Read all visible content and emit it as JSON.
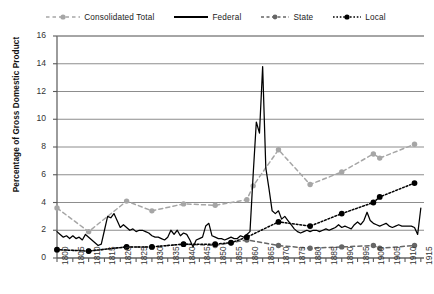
{
  "chart_data": {
    "type": "line",
    "title": "",
    "xlabel": "",
    "ylabel": "Percentage of Gross Domestic Product",
    "xlim": [
      1800,
      1916
    ],
    "ylim": [
      0,
      16
    ],
    "ytick_step": 2,
    "xtick_step": 5,
    "grid": "horizontal",
    "legend_position": "top",
    "yticks": [
      "0",
      "2",
      "4",
      "6",
      "8",
      "10",
      "12",
      "14",
      "16"
    ],
    "xticks": [
      "1800",
      "1805",
      "1810",
      "1815",
      "1820",
      "1825",
      "1830",
      "1835",
      "1840",
      "1845",
      "1850",
      "1855",
      "1860",
      "1865",
      "1870",
      "1875",
      "1880",
      "1885",
      "1890",
      "1895",
      "1900",
      "1905",
      "1910",
      "1915"
    ],
    "series": [
      {
        "name": "Consolidated Total",
        "color": "#a6a6a6",
        "style": "dashed-marker",
        "x": [
          1800,
          1810,
          1822,
          1830,
          1840,
          1850,
          1860,
          1862,
          1870,
          1880,
          1890,
          1900,
          1902,
          1913
        ],
        "values": [
          3.6,
          1.9,
          4.1,
          3.4,
          3.9,
          3.8,
          4.2,
          5.2,
          7.8,
          5.3,
          6.2,
          7.5,
          7.2,
          8.2
        ]
      },
      {
        "name": "Federal",
        "color": "#000000",
        "style": "solid",
        "x": [
          1800,
          1801,
          1802,
          1803,
          1804,
          1805,
          1806,
          1807,
          1808,
          1809,
          1810,
          1811,
          1812,
          1813,
          1814,
          1815,
          1816,
          1817,
          1818,
          1819,
          1820,
          1821,
          1822,
          1823,
          1824,
          1825,
          1826,
          1827,
          1828,
          1829,
          1830,
          1831,
          1832,
          1833,
          1834,
          1835,
          1836,
          1837,
          1838,
          1839,
          1840,
          1841,
          1842,
          1843,
          1844,
          1845,
          1846,
          1847,
          1848,
          1849,
          1850,
          1851,
          1852,
          1853,
          1854,
          1855,
          1856,
          1857,
          1858,
          1859,
          1860,
          1861,
          1862,
          1863,
          1864,
          1865,
          1866,
          1867,
          1868,
          1869,
          1870,
          1871,
          1872,
          1873,
          1874,
          1875,
          1876,
          1877,
          1878,
          1879,
          1880,
          1881,
          1882,
          1883,
          1884,
          1885,
          1886,
          1887,
          1888,
          1889,
          1890,
          1891,
          1892,
          1893,
          1894,
          1895,
          1896,
          1897,
          1898,
          1899,
          1900,
          1901,
          1902,
          1903,
          1904,
          1905,
          1906,
          1907,
          1908,
          1909,
          1910,
          1911,
          1912,
          1913,
          1914,
          1915
        ],
        "values": [
          1.9,
          1.7,
          1.5,
          1.6,
          1.4,
          1.6,
          1.4,
          1.5,
          1.3,
          1.7,
          1.5,
          1.3,
          1.1,
          0.9,
          1.0,
          2.0,
          3.0,
          2.9,
          3.2,
          2.7,
          2.2,
          2.4,
          2.2,
          2.0,
          2.1,
          1.9,
          2.0,
          2.0,
          1.9,
          1.8,
          1.6,
          1.5,
          1.5,
          1.4,
          1.3,
          1.5,
          2.0,
          1.7,
          2.0,
          1.6,
          1.8,
          1.7,
          1.3,
          0.8,
          1.3,
          1.4,
          1.5,
          2.3,
          2.5,
          1.6,
          1.5,
          1.4,
          1.4,
          1.3,
          1.4,
          1.5,
          1.4,
          1.4,
          1.6,
          1.5,
          1.7,
          1.9,
          6.0,
          9.8,
          9.0,
          13.8,
          6.5,
          5.0,
          3.4,
          3.2,
          3.4,
          2.8,
          3.0,
          2.7,
          2.4,
          2.1,
          1.9,
          1.8,
          1.9,
          2.0,
          1.9,
          2.0,
          2.0,
          1.9,
          2.0,
          2.1,
          2.0,
          2.1,
          2.2,
          2.4,
          2.2,
          2.3,
          2.2,
          2.1,
          2.4,
          2.6,
          2.4,
          2.7,
          3.3,
          2.7,
          2.5,
          2.4,
          2.3,
          2.4,
          2.5,
          2.3,
          2.2,
          2.3,
          2.4,
          2.3,
          2.3,
          2.3,
          2.3,
          2.2,
          1.7,
          3.6
        ]
      },
      {
        "name": "State",
        "color": "#666666",
        "style": "dashed-marker",
        "x": [
          1800,
          1810,
          1822,
          1830,
          1840,
          1850,
          1855,
          1860,
          1870,
          1880,
          1890,
          1900,
          1902,
          1913
        ],
        "values": [
          0.6,
          0.5,
          0.8,
          0.8,
          1.0,
          0.9,
          1.1,
          1.3,
          0.9,
          0.7,
          0.8,
          0.9,
          0.7,
          0.9
        ]
      },
      {
        "name": "Local",
        "color": "#000000",
        "style": "dotted-marker",
        "x": [
          1800,
          1810,
          1822,
          1830,
          1840,
          1850,
          1855,
          1860,
          1870,
          1880,
          1890,
          1900,
          1902,
          1913
        ],
        "values": [
          0.6,
          0.5,
          0.8,
          0.8,
          1.0,
          1.0,
          1.1,
          1.5,
          2.6,
          2.3,
          3.2,
          4.0,
          4.4,
          5.4
        ]
      }
    ]
  },
  "legend": {
    "items": [
      {
        "label": "Consolidated Total",
        "swatch": "dashed-marker-gray"
      },
      {
        "label": "Federal",
        "swatch": "solid-black"
      },
      {
        "label": "State",
        "swatch": "dashed-marker-darkgray"
      },
      {
        "label": "Local",
        "swatch": "dotted-marker-black"
      }
    ]
  },
  "axes": {
    "y_title": "Percentage of Gross Domestic Product"
  }
}
